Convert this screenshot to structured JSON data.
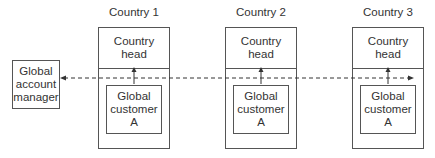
{
  "diagram": {
    "global_account_manager": {
      "label": "Global account manager",
      "lines": [
        "Global",
        "account",
        "manager"
      ]
    },
    "countries": [
      {
        "title": "Country 1",
        "head_label": [
          "Country",
          "head"
        ],
        "customer_label": [
          "Global",
          "customer",
          "A"
        ]
      },
      {
        "title": "Country 2",
        "head_label": [
          "Country",
          "head"
        ],
        "customer_label": [
          "Global",
          "customer",
          "A"
        ]
      },
      {
        "title": "Country 3",
        "head_label": [
          "Country",
          "head"
        ],
        "customer_label": [
          "Global",
          "customer",
          "A"
        ]
      }
    ],
    "connectors": {
      "dashed_line": "bidirectional dashed arrow linking Global account manager across all countries",
      "vertical_arrows": "Global customer A reports up to Country head in each country"
    },
    "colors": {
      "line": "#555555",
      "text": "#333333",
      "background": "#ffffff"
    }
  }
}
